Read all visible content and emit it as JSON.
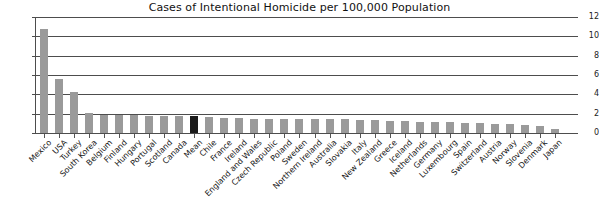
{
  "chart_data": {
    "type": "bar",
    "title": "Cases of Intentional Homicide per 100,000 Population",
    "xlabel": "",
    "ylabel": "",
    "ylim": [
      0,
      12
    ],
    "yticks": [
      0,
      2,
      4,
      6,
      8,
      10,
      12
    ],
    "grid": true,
    "legend": "none",
    "highlight_category": "Mean",
    "colors": {
      "bar": "#9a9a9a",
      "highlight_bar": "#1b1b1b",
      "axis": "#4d4d4d",
      "text": "#161616",
      "background": "#ffffff"
    },
    "categories": [
      "Mexico",
      "USA",
      "Turkey",
      "South Korea",
      "Belgium",
      "Finland",
      "Hungary",
      "Portugal",
      "Scotland",
      "Canada",
      "Mean",
      "Chile",
      "France",
      "Ireland",
      "England and Wales",
      "Czech Republic",
      "Poland",
      "Sweden",
      "Northern Ireland",
      "Australia",
      "Slovakia",
      "Italy",
      "New Zealand",
      "Greece",
      "Iceland",
      "Netherlands",
      "Germany",
      "Luxembourg",
      "Spain",
      "Switzerland",
      "Austria",
      "Norway",
      "Slovenia",
      "Denmark",
      "Japan"
    ],
    "values": [
      10.8,
      5.6,
      4.2,
      2.1,
      1.9,
      1.9,
      1.9,
      1.8,
      1.8,
      1.8,
      1.8,
      1.7,
      1.6,
      1.6,
      1.5,
      1.5,
      1.5,
      1.5,
      1.4,
      1.4,
      1.4,
      1.3,
      1.3,
      1.2,
      1.2,
      1.1,
      1.1,
      1.1,
      1.0,
      1.0,
      0.9,
      0.9,
      0.8,
      0.7,
      0.4
    ]
  }
}
